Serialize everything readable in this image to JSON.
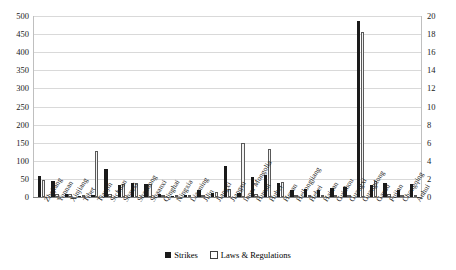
{
  "chart_data": {
    "type": "bar",
    "title": "",
    "xlabel": "",
    "ylabel": "",
    "ylim": [
      0,
      500
    ],
    "y2lim": [
      0,
      20
    ],
    "grid": true,
    "legend_position": "bottom",
    "y_ticks": [
      "0",
      "50",
      "100",
      "150",
      "200",
      "250",
      "300",
      "350",
      "400",
      "450",
      "500"
    ],
    "y2_ticks": [
      "0",
      "2",
      "4",
      "6",
      "8",
      "10",
      "12",
      "14",
      "16",
      "18",
      "20"
    ],
    "categories": [
      "Zhejiang",
      "Yunnan",
      "Xinjiang",
      "Tibet",
      "Tianjin",
      "Sichuan",
      "Shanxi",
      "Shandong",
      "Shaanxi",
      "Qinghai",
      "Ningxia",
      "Liaoning",
      "Jilin",
      "Jiangxi",
      "Jiangsu",
      "Inner Mongolia",
      "Hunan",
      "Hubei",
      "Henan",
      "Heilongjiang",
      "Hebei",
      "Hainan",
      "Guizhou",
      "Guangxi",
      "Guangdong",
      "Gansu",
      "Fujian",
      "Chongqing",
      "Anhui"
    ],
    "series": [
      {
        "name": "Strikes",
        "axis": "left",
        "color": "#1a1a1a",
        "values": [
          58,
          45,
          8,
          2,
          6,
          78,
          33,
          38,
          35,
          8,
          3,
          6,
          20,
          10,
          85,
          12,
          55,
          60,
          40,
          20,
          22,
          20,
          25,
          28,
          485,
          32,
          40,
          20,
          35
        ]
      },
      {
        "name": "Laws & Regulations",
        "axis": "right",
        "color": "#f2f2f2",
        "values": [
          1.9,
          0.3,
          0.3,
          0.1,
          5.1,
          0.3,
          1.4,
          1.5,
          1.4,
          0.1,
          0.1,
          0.1,
          0.2,
          0.5,
          0.9,
          6.0,
          0.3,
          5.3,
          1.7,
          0.2,
          0.2,
          0.1,
          0.2,
          0.2,
          18.2,
          1.8,
          0.3,
          0.1,
          0.2
        ]
      }
    ]
  },
  "legend": {
    "items": [
      {
        "label": "Strikes",
        "style": "filled"
      },
      {
        "label": "Laws & Regulations",
        "style": "outlined"
      }
    ]
  }
}
